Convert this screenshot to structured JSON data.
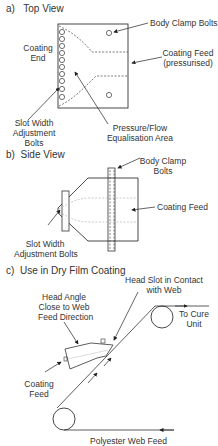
{
  "sections": {
    "a": {
      "letter": "a)",
      "title": "Top View"
    },
    "b": {
      "letter": "b)",
      "title": "Side View"
    },
    "c": {
      "letter": "c)",
      "title": "Use in Dry Film Coating"
    }
  },
  "top_view": {
    "body_clamp_bolts": "Body Clamp Bolts",
    "coating_end_1": "Coating",
    "coating_end_2": "End",
    "coating_feed_1": "Coating Feed",
    "coating_feed_2": "(pressurised)",
    "slot_width_1": "Slot Width",
    "slot_width_2": "Adjustment",
    "slot_width_3": "Bolts",
    "pressure_1": "Pressure/Flow",
    "pressure_2": "Equalisation Area"
  },
  "side_view": {
    "body_clamp_1": "Body Clamp",
    "body_clamp_2": "Bolts",
    "coating_feed": "Coating Feed",
    "slot_width_1": "Slot Width",
    "slot_width_2": "Adjustment Bolts"
  },
  "use_view": {
    "head_slot_1": "Head Slot in Contact",
    "head_slot_2": "with Web",
    "head_angle_1": "Head Angle",
    "head_angle_2": "Close to Web",
    "head_angle_3": "Feed Direction",
    "to_cure_1": "To Cure",
    "to_cure_2": "Unit",
    "coating_feed_1": "Coating",
    "coating_feed_2": "Feed",
    "polyester": "Polyester Web Feed"
  }
}
